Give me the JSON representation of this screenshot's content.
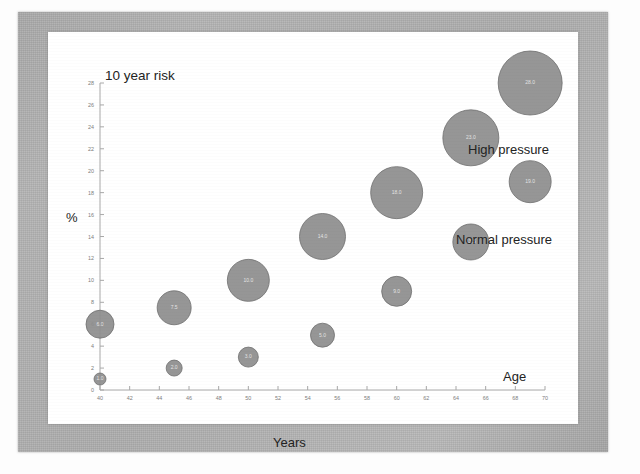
{
  "figure": {
    "title_note": "10 year risk",
    "series_labels": {
      "high": "High pressure",
      "normal": "Normal pressure"
    },
    "x_axis_caption": "Years",
    "x_axis_note": "Age",
    "y_axis_caption": "%"
  },
  "chart_data": {
    "type": "scatter",
    "title": "10 year risk",
    "xlabel": "Years",
    "ylabel": "%",
    "xlim": [
      40,
      70
    ],
    "ylim": [
      0,
      28
    ],
    "grid": false,
    "legend_position": "inline-annotations",
    "annotations": [
      "10 year risk",
      "High pressure",
      "Normal pressure",
      "Age"
    ],
    "x_ticks": [
      40,
      42,
      44,
      46,
      48,
      50,
      52,
      54,
      56,
      58,
      60,
      62,
      64,
      66,
      68,
      70
    ],
    "y_ticks": [
      0,
      2,
      4,
      6,
      8,
      10,
      12,
      14,
      16,
      18,
      20,
      22,
      24,
      26,
      28
    ],
    "series": [
      {
        "name": "High pressure",
        "points": [
          {
            "x": 40,
            "y": 6,
            "size": 14,
            "label": "6.0"
          },
          {
            "x": 45,
            "y": 7.5,
            "size": 17,
            "label": "7.5"
          },
          {
            "x": 50,
            "y": 10,
            "size": 21,
            "label": "10.0"
          },
          {
            "x": 55,
            "y": 14,
            "size": 23,
            "label": "14.0"
          },
          {
            "x": 60,
            "y": 18,
            "size": 26,
            "label": "18.0"
          },
          {
            "x": 65,
            "y": 23,
            "size": 28,
            "label": "23.0"
          },
          {
            "x": 69,
            "y": 28,
            "size": 32,
            "label": "28.0"
          }
        ]
      },
      {
        "name": "Normal pressure",
        "points": [
          {
            "x": 40,
            "y": 1,
            "size": 6,
            "label": "1.0"
          },
          {
            "x": 45,
            "y": 2,
            "size": 8,
            "label": "2.0"
          },
          {
            "x": 50,
            "y": 3,
            "size": 10,
            "label": "3.0"
          },
          {
            "x": 55,
            "y": 5,
            "size": 12,
            "label": "5.0"
          },
          {
            "x": 60,
            "y": 9,
            "size": 15,
            "label": "9.0"
          },
          {
            "x": 65,
            "y": 13.5,
            "size": 18,
            "label": "13.5"
          },
          {
            "x": 69,
            "y": 19,
            "size": 21,
            "label": "19.0"
          }
        ]
      }
    ]
  },
  "colors": {
    "bubble_fill": "#8d8d8d",
    "bubble_stroke": "#6f6f6f",
    "axis": "#a8a8a8",
    "frame": "#b0b0b0",
    "page": "#ffffff",
    "text": "#232323"
  }
}
